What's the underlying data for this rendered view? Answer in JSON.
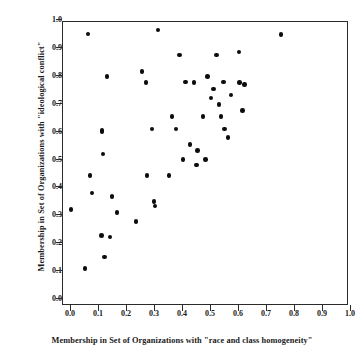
{
  "chart": {
    "type": "scatter",
    "xlabel": "Membership in Set of Organizations with \"race and class homogeneity\"",
    "ylabel": "Membership in Set of Organizations with \"ideological conflict\"",
    "title": ""
  },
  "chart_data": {
    "type": "scatter",
    "title": "",
    "xlabel": "Membership in Set of Organizations with \"race and class homogeneity\"",
    "ylabel": "Membership in Set of Organizations with \"ideological conflict\"",
    "xlim": [
      0.0,
      1.0
    ],
    "ylim": [
      0.0,
      1.0
    ],
    "xticks": [
      0.0,
      0.1,
      0.2,
      0.3,
      0.4,
      0.5,
      0.6,
      0.7,
      0.8,
      0.9,
      1.0
    ],
    "yticks": [
      0.0,
      0.1,
      0.2,
      0.3,
      0.4,
      0.5,
      0.6,
      0.7,
      0.8,
      0.9,
      1.0
    ],
    "xticklabels": [
      "0.0",
      "0.1",
      "0.2",
      "0.3",
      "0.4",
      "0.5",
      "0.6",
      "0.7",
      "0.8",
      "0.9",
      "1.0"
    ],
    "yticklabels": [
      "0.0",
      "0.1",
      "0.2",
      "0.3",
      "0.4",
      "0.5",
      "0.6",
      "0.7",
      "0.8",
      "0.9",
      "1.0"
    ],
    "grid": false,
    "legend": null,
    "marker_color": "#0c0c0c",
    "points": [
      [
        0.0,
        0.32
      ],
      [
        0.05,
        0.11
      ],
      [
        0.06,
        0.95
      ],
      [
        0.068,
        0.443
      ],
      [
        0.075,
        0.38
      ],
      [
        0.11,
        0.605
      ],
      [
        0.11,
        0.598
      ],
      [
        0.108,
        0.228
      ],
      [
        0.115,
        0.52
      ],
      [
        0.12,
        0.15
      ],
      [
        0.128,
        0.798
      ],
      [
        0.14,
        0.222
      ],
      [
        0.146,
        0.367
      ],
      [
        0.165,
        0.31
      ],
      [
        0.232,
        0.278
      ],
      [
        0.254,
        0.816
      ],
      [
        0.268,
        0.776
      ],
      [
        0.272,
        0.443
      ],
      [
        0.29,
        0.61
      ],
      [
        0.296,
        0.35
      ],
      [
        0.3,
        0.333
      ],
      [
        0.31,
        0.964
      ],
      [
        0.35,
        0.443
      ],
      [
        0.36,
        0.654
      ],
      [
        0.375,
        0.61
      ],
      [
        0.388,
        0.875
      ],
      [
        0.4,
        0.5
      ],
      [
        0.408,
        0.778
      ],
      [
        0.425,
        0.554
      ],
      [
        0.44,
        0.776
      ],
      [
        0.448,
        0.48
      ],
      [
        0.452,
        0.532
      ],
      [
        0.472,
        0.654
      ],
      [
        0.48,
        0.5
      ],
      [
        0.488,
        0.798
      ],
      [
        0.5,
        0.72
      ],
      [
        0.508,
        0.753
      ],
      [
        0.52,
        0.875
      ],
      [
        0.528,
        0.697
      ],
      [
        0.535,
        0.654
      ],
      [
        0.545,
        0.778
      ],
      [
        0.548,
        0.61
      ],
      [
        0.56,
        0.578
      ],
      [
        0.572,
        0.731
      ],
      [
        0.6,
        0.886
      ],
      [
        0.602,
        0.775
      ],
      [
        0.612,
        0.675
      ],
      [
        0.62,
        0.768
      ],
      [
        0.75,
        0.947
      ]
    ]
  }
}
